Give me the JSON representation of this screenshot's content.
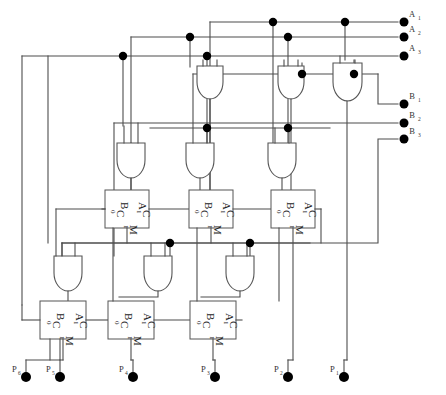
{
  "diagram": {
    "canvas": {
      "width": 446,
      "height": 395
    },
    "wire_color": "#4d4d4d",
    "gate_fill": "#ffffff",
    "dot_color": "#000000"
  },
  "inputs": {
    "a": [
      {
        "name": "A1",
        "letter": "A",
        "index": "1",
        "x": 418,
        "y": 12,
        "bus_y": 22
      },
      {
        "name": "A2",
        "letter": "A",
        "index": "2",
        "x": 418,
        "y": 27,
        "bus_y": 37
      },
      {
        "name": "A3",
        "letter": "A",
        "index": "3",
        "x": 418,
        "y": 46,
        "bus_y": 56
      }
    ],
    "b": [
      {
        "name": "B1",
        "letter": "B",
        "index": "1",
        "x": 418,
        "y": 95,
        "bus_y": 104
      },
      {
        "name": "B2",
        "letter": "B",
        "index": "2",
        "x": 418,
        "y": 114,
        "bus_y": 123
      },
      {
        "name": "B3",
        "letter": "B",
        "index": "3",
        "x": 418,
        "y": 130,
        "bus_y": 139
      }
    ]
  },
  "outputs": [
    {
      "name": "P6",
      "letter": "P",
      "index": "6",
      "x": 16,
      "y": 368,
      "term_x": 26,
      "term_y": 377
    },
    {
      "name": "P5",
      "letter": "P",
      "index": "5",
      "x": 48,
      "y": 368,
      "term_x": 60,
      "term_y": 377
    },
    {
      "name": "P4",
      "letter": "P",
      "index": "4",
      "x": 121,
      "y": 368,
      "term_x": 133,
      "term_y": 377
    },
    {
      "name": "P3",
      "letter": "P",
      "index": "3",
      "x": 203,
      "y": 368,
      "term_x": 215,
      "term_y": 377
    },
    {
      "name": "P2",
      "letter": "P",
      "index": "2",
      "x": 276,
      "y": 368,
      "term_x": 288,
      "term_y": 377
    },
    {
      "name": "P1",
      "letter": "P",
      "index": "1",
      "x": 332,
      "y": 368,
      "term_x": 344,
      "term_y": 377
    }
  ],
  "adders": {
    "pin_labels": {
      "b": "B",
      "a": "A",
      "c_in": "C",
      "c_in_sub": "0",
      "c_out": "C",
      "c_out_sub": "1",
      "sum": "M",
      "sum_sub": "1"
    },
    "row_upper": [
      {
        "id": "adder-u1",
        "x": 105,
        "y": 190,
        "w": 44,
        "h": 38
      },
      {
        "id": "adder-u2",
        "x": 189,
        "y": 190,
        "w": 44,
        "h": 38
      },
      {
        "id": "adder-u3",
        "x": 271,
        "y": 190,
        "w": 44,
        "h": 38
      }
    ],
    "row_lower": [
      {
        "id": "adder-l1",
        "x": 40,
        "y": 301,
        "w": 46,
        "h": 38
      },
      {
        "id": "adder-l2",
        "x": 108,
        "y": 301,
        "w": 46,
        "h": 38
      },
      {
        "id": "adder-l3",
        "x": 190,
        "y": 301,
        "w": 46,
        "h": 38
      }
    ]
  },
  "and_gates": {
    "count": 9,
    "label": "AND",
    "row_top": [
      {
        "id": "and-t1",
        "cx": 210,
        "y": 83,
        "w": 26,
        "h": 34
      },
      {
        "id": "and-t2",
        "cx": 291,
        "y": 83,
        "w": 26,
        "h": 34
      },
      {
        "id": "and-t3",
        "cx": 347,
        "y": 80,
        "w": 30,
        "h": 40
      }
    ],
    "row_mid": [
      {
        "id": "and-m1",
        "cx": 131,
        "y": 143,
        "w": 28,
        "h": 36
      },
      {
        "id": "and-m2",
        "cx": 200,
        "y": 143,
        "w": 28,
        "h": 36
      },
      {
        "id": "and-m3",
        "cx": 282,
        "y": 143,
        "w": 28,
        "h": 36
      }
    ],
    "row_bot": [
      {
        "id": "and-b1",
        "cx": 68,
        "y": 256,
        "w": 28,
        "h": 36
      },
      {
        "id": "and-b2",
        "cx": 158,
        "y": 256,
        "w": 28,
        "h": 36
      },
      {
        "id": "and-b3",
        "cx": 240,
        "y": 256,
        "w": 28,
        "h": 36
      }
    ]
  },
  "junctions": [
    {
      "x": 273,
      "y": 22
    },
    {
      "x": 345,
      "y": 22
    },
    {
      "x": 190,
      "y": 37
    },
    {
      "x": 288,
      "y": 37
    },
    {
      "x": 123,
      "y": 56
    },
    {
      "x": 207,
      "y": 56
    },
    {
      "x": 302,
      "y": 74
    },
    {
      "x": 354,
      "y": 74
    },
    {
      "x": 207,
      "y": 128
    },
    {
      "x": 288,
      "y": 128
    },
    {
      "x": 170,
      "y": 243
    },
    {
      "x": 250,
      "y": 243
    }
  ],
  "buses": {
    "a1_y": 22,
    "a2_y": 37,
    "a3_y": 56,
    "b1_y": 104,
    "b2_y": 123,
    "b3_y": 139,
    "mid_y": 74,
    "low_y": 128,
    "bot_y": 243,
    "right_edge": 398
  }
}
